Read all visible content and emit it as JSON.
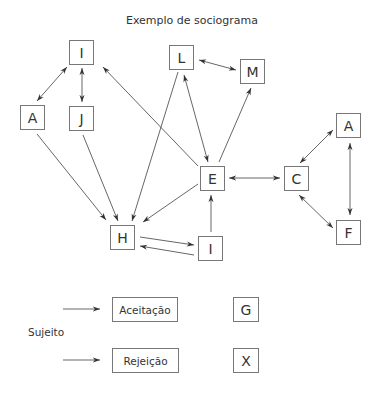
{
  "title": "Exemplo de sociograma",
  "nodes": [
    {
      "id": "I_top",
      "label": "I",
      "x": 69,
      "y": 40
    },
    {
      "id": "L",
      "label": "L",
      "x": 169,
      "y": 45
    },
    {
      "id": "M",
      "label": "M",
      "x": 240,
      "y": 59
    },
    {
      "id": "A_left",
      "label": "A",
      "x": 20,
      "y": 105
    },
    {
      "id": "J",
      "label": "J",
      "x": 69,
      "y": 106
    },
    {
      "id": "A_right",
      "label": "A",
      "x": 336,
      "y": 113
    },
    {
      "id": "E",
      "label": "E",
      "x": 200,
      "y": 166
    },
    {
      "id": "C",
      "label": "C",
      "x": 284,
      "y": 166
    },
    {
      "id": "F",
      "label": "F",
      "x": 336,
      "y": 220
    },
    {
      "id": "H",
      "label": "H",
      "x": 110,
      "y": 225
    },
    {
      "id": "I_bottom",
      "label": "I",
      "x": 198,
      "y": 236
    }
  ],
  "edges": [
    {
      "from": "I_top",
      "to": "A_left",
      "type": "mutual"
    },
    {
      "from": "I_top",
      "to": "J",
      "type": "mutual"
    },
    {
      "from": "E",
      "to": "I_top",
      "type": "one-way"
    },
    {
      "from": "L",
      "to": "M",
      "type": "mutual"
    },
    {
      "from": "L",
      "to": "E",
      "type": "mutual"
    },
    {
      "from": "E",
      "to": "M",
      "type": "one-way"
    },
    {
      "from": "L",
      "to": "H",
      "type": "one-way"
    },
    {
      "from": "A_left",
      "to": "H",
      "type": "one-way"
    },
    {
      "from": "J",
      "to": "H",
      "type": "one-way"
    },
    {
      "from": "E",
      "to": "H",
      "type": "one-way"
    },
    {
      "from": "E",
      "to": "C",
      "type": "mutual"
    },
    {
      "from": "C",
      "to": "A_right",
      "type": "mutual"
    },
    {
      "from": "C",
      "to": "F",
      "type": "mutual"
    },
    {
      "from": "A_right",
      "to": "F",
      "type": "mutual"
    },
    {
      "from": "I_bottom",
      "to": "E",
      "type": "one-way"
    },
    {
      "from": "H",
      "to": "I_bottom",
      "type": "one-way"
    },
    {
      "from": "I_bottom",
      "to": "H",
      "type": "one-way"
    }
  ],
  "legend": {
    "subject_label": "Sujeito",
    "items": [
      {
        "label": "Aceitação",
        "symbol": "G"
      },
      {
        "label": "Rejeição",
        "symbol": "X"
      }
    ]
  }
}
